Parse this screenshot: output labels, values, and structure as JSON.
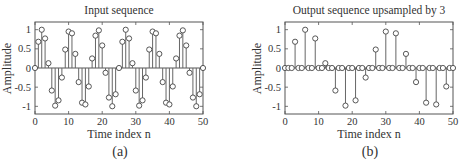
{
  "chart_data": [
    {
      "type": "stem",
      "panel": "a",
      "title": "Input sequence",
      "xlabel": "Time index n",
      "ylabel": "Amplitude",
      "caption": "(a)",
      "xlim": [
        0,
        50
      ],
      "ylim": [
        -1.2,
        1.2
      ],
      "xticks": [
        0,
        10,
        20,
        30,
        40,
        50
      ],
      "yticks": [
        1,
        0.5,
        0,
        -0.5,
        -1
      ],
      "ytick_labels": [
        "1",
        "0.5",
        "0",
        "-0.5",
        "-1"
      ],
      "grid": false,
      "x": [
        0,
        1,
        2,
        3,
        4,
        5,
        6,
        7,
        8,
        9,
        10,
        11,
        12,
        13,
        14,
        15,
        16,
        17,
        18,
        19,
        20,
        21,
        22,
        23,
        24,
        25,
        26,
        27,
        28,
        29,
        30,
        31,
        32,
        33,
        34,
        35,
        36,
        37,
        38,
        39,
        40,
        41,
        42,
        43,
        44,
        45,
        46,
        47,
        48,
        49,
        50
      ],
      "values": [
        0,
        0.685,
        0.998,
        0.771,
        0.125,
        -0.588,
        -0.982,
        -0.844,
        -0.249,
        0.482,
        0.951,
        0.905,
        0.368,
        -0.368,
        -0.905,
        -0.951,
        -0.482,
        0.249,
        0.844,
        0.982,
        0.588,
        -0.125,
        -0.771,
        -0.998,
        -0.685,
        0,
        0.685,
        0.998,
        0.771,
        0.125,
        -0.588,
        -0.982,
        -0.844,
        -0.249,
        0.482,
        0.951,
        0.905,
        0.368,
        -0.368,
        -0.905,
        -0.951,
        -0.482,
        0.249,
        0.844,
        0.982,
        0.588,
        -0.125,
        -0.771,
        -0.998,
        -0.685,
        0
      ]
    },
    {
      "type": "stem",
      "panel": "b",
      "title": "Output sequence upsampled by 3",
      "xlabel": "Time index n",
      "ylabel": "Amplitude",
      "caption": "(b)",
      "xlim": [
        0,
        50
      ],
      "ylim": [
        -1.2,
        1.2
      ],
      "xticks": [
        0,
        10,
        20,
        30,
        40,
        50
      ],
      "yticks": [
        1,
        0.5,
        0,
        -0.5,
        -1
      ],
      "ytick_labels": [
        "1",
        "0.5",
        "0",
        "-0.5",
        "-1"
      ],
      "grid": false,
      "x": [
        0,
        1,
        2,
        3,
        4,
        5,
        6,
        7,
        8,
        9,
        10,
        11,
        12,
        13,
        14,
        15,
        16,
        17,
        18,
        19,
        20,
        21,
        22,
        23,
        24,
        25,
        26,
        27,
        28,
        29,
        30,
        31,
        32,
        33,
        34,
        35,
        36,
        37,
        38,
        39,
        40,
        41,
        42,
        43,
        44,
        45,
        46,
        47,
        48,
        49,
        50
      ],
      "values": [
        0,
        0,
        0,
        0.685,
        0,
        0,
        0.998,
        0,
        0,
        0.771,
        0,
        0,
        0.125,
        0,
        0,
        -0.588,
        0,
        0,
        -0.982,
        0,
        0,
        -0.844,
        0,
        0,
        -0.249,
        0,
        0,
        0.482,
        0,
        0,
        0.951,
        0,
        0,
        0.905,
        0,
        0,
        0.368,
        0,
        0,
        -0.368,
        0,
        0,
        -0.905,
        0,
        0,
        -0.951,
        0,
        0,
        -0.482,
        0,
        0
      ]
    }
  ]
}
